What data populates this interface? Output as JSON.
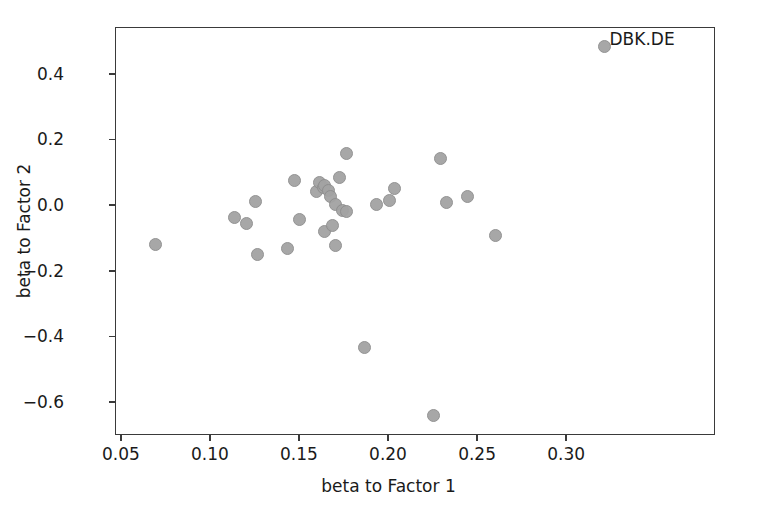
{
  "chart_data": {
    "type": "scatter",
    "title": "",
    "xlabel": "beta to Factor 1",
    "ylabel": "beta to Factor 2",
    "xlim": [
      0.0467,
      0.3836
    ],
    "ylim": [
      -0.7,
      0.5425
    ],
    "xticks": [
      0.05,
      0.1,
      0.15,
      0.2,
      0.25,
      0.3
    ],
    "xticklabels": [
      "0.05",
      "0.10",
      "0.15",
      "0.20",
      "0.25",
      "0.30"
    ],
    "yticks": [
      0.4,
      0.2,
      0.0,
      -0.2,
      -0.4,
      -0.6
    ],
    "yticklabels": [
      "0.4",
      "0.2",
      "0.0",
      "−0.2",
      "−0.4",
      "−0.6"
    ],
    "grid": false,
    "legend": null,
    "marker_color": "#a3a3a3",
    "marker_edge_color": "#8e8e8e",
    "points": [
      {
        "x": 0.069,
        "y": -0.118,
        "label": ""
      },
      {
        "x": 0.113,
        "y": -0.036,
        "label": ""
      },
      {
        "x": 0.12,
        "y": -0.053,
        "label": ""
      },
      {
        "x": 0.125,
        "y": 0.013,
        "label": ""
      },
      {
        "x": 0.126,
        "y": -0.146,
        "label": ""
      },
      {
        "x": 0.143,
        "y": -0.13,
        "label": ""
      },
      {
        "x": 0.147,
        "y": 0.079,
        "label": ""
      },
      {
        "x": 0.15,
        "y": -0.042,
        "label": ""
      },
      {
        "x": 0.159,
        "y": 0.045,
        "label": ""
      },
      {
        "x": 0.161,
        "y": 0.072,
        "label": ""
      },
      {
        "x": 0.163,
        "y": 0.056,
        "label": ""
      },
      {
        "x": 0.164,
        "y": 0.062,
        "label": ""
      },
      {
        "x": 0.164,
        "y": -0.076,
        "label": ""
      },
      {
        "x": 0.166,
        "y": 0.049,
        "label": ""
      },
      {
        "x": 0.167,
        "y": 0.03,
        "label": ""
      },
      {
        "x": 0.168,
        "y": -0.059,
        "label": ""
      },
      {
        "x": 0.17,
        "y": 0.006,
        "label": ""
      },
      {
        "x": 0.17,
        "y": -0.121,
        "label": ""
      },
      {
        "x": 0.172,
        "y": 0.086,
        "label": ""
      },
      {
        "x": 0.174,
        "y": -0.013,
        "label": ""
      },
      {
        "x": 0.176,
        "y": -0.017,
        "label": ""
      },
      {
        "x": 0.176,
        "y": 0.161,
        "label": ""
      },
      {
        "x": 0.186,
        "y": -0.43,
        "label": ""
      },
      {
        "x": 0.193,
        "y": 0.006,
        "label": ""
      },
      {
        "x": 0.2,
        "y": 0.018,
        "label": ""
      },
      {
        "x": 0.203,
        "y": 0.053,
        "label": ""
      },
      {
        "x": 0.225,
        "y": -0.639,
        "label": ""
      },
      {
        "x": 0.229,
        "y": 0.145,
        "label": ""
      },
      {
        "x": 0.232,
        "y": 0.01,
        "label": ""
      },
      {
        "x": 0.244,
        "y": 0.028,
        "label": ""
      },
      {
        "x": 0.26,
        "y": -0.09,
        "label": ""
      },
      {
        "x": 0.321,
        "y": 0.487,
        "label": "DBK.DE"
      }
    ]
  }
}
